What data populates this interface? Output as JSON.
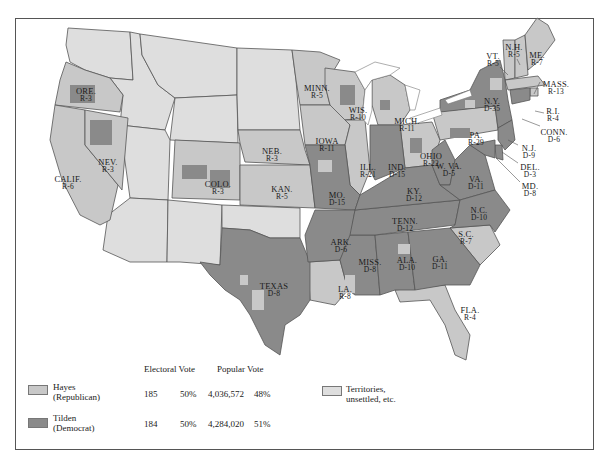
{
  "colors": {
    "republican": "#c8c8c8",
    "democrat": "#8a8a8a",
    "territory": "#dedede",
    "border": "#555555",
    "water": "#ffffff"
  },
  "legend": {
    "header_electoral": "Electoral Vote",
    "header_popular": "Popular Vote",
    "rows": [
      {
        "name": "Hayes",
        "party": "(Republican)",
        "electoral": "185",
        "electoral_pct": "50%",
        "popular": "4,036,572",
        "popular_pct": "48%"
      },
      {
        "name": "Tilden",
        "party": "(Democrat)",
        "electoral": "184",
        "electoral_pct": "50%",
        "popular": "4,284,020",
        "popular_pct": "51%"
      }
    ],
    "territory_line1": "Territories,",
    "territory_line2": "unsettled, etc."
  },
  "states": [
    {
      "abbr": "ORE.",
      "ev": "R-3"
    },
    {
      "abbr": "CALIF.",
      "ev": "R-6"
    },
    {
      "abbr": "NEV.",
      "ev": "R-3"
    },
    {
      "abbr": "COLO.",
      "ev": "R-3"
    },
    {
      "abbr": "NEB.",
      "ev": "R-3"
    },
    {
      "abbr": "KAN.",
      "ev": "R-5"
    },
    {
      "abbr": "TEXAS",
      "ev": "D-8"
    },
    {
      "abbr": "MINN.",
      "ev": "R-5"
    },
    {
      "abbr": "IOWA",
      "ev": "R-11"
    },
    {
      "abbr": "MO.",
      "ev": "D-15"
    },
    {
      "abbr": "ARK.",
      "ev": "D-6"
    },
    {
      "abbr": "LA.",
      "ev": "R-8"
    },
    {
      "abbr": "WIS.",
      "ev": "R-10"
    },
    {
      "abbr": "ILL.",
      "ev": "R-21"
    },
    {
      "abbr": "MISS.",
      "ev": "D-8"
    },
    {
      "abbr": "MICH.",
      "ev": "R-11"
    },
    {
      "abbr": "IND.",
      "ev": "D-15"
    },
    {
      "abbr": "KY.",
      "ev": "D-12"
    },
    {
      "abbr": "TENN.",
      "ev": "D-12"
    },
    {
      "abbr": "ALA.",
      "ev": "D-10"
    },
    {
      "abbr": "OHIO",
      "ev": "R-22"
    },
    {
      "abbr": "W. VA.",
      "ev": "D-5"
    },
    {
      "abbr": "VA.",
      "ev": "D-11"
    },
    {
      "abbr": "N.C.",
      "ev": "D-10"
    },
    {
      "abbr": "S.C.",
      "ev": "R-7"
    },
    {
      "abbr": "GA.",
      "ev": "D-11"
    },
    {
      "abbr": "FLA.",
      "ev": "R-4"
    },
    {
      "abbr": "PA.",
      "ev": "R-29"
    },
    {
      "abbr": "N.Y.",
      "ev": "D-35"
    },
    {
      "abbr": "VT.",
      "ev": "R-5"
    },
    {
      "abbr": "N.H.",
      "ev": "R-5"
    },
    {
      "abbr": "ME.",
      "ev": "R-7"
    },
    {
      "abbr": "MASS.",
      "ev": "R-13"
    },
    {
      "abbr": "R.I.",
      "ev": "R-4"
    },
    {
      "abbr": "CONN.",
      "ev": "D-6"
    },
    {
      "abbr": "N.J.",
      "ev": "D-9"
    },
    {
      "abbr": "DEL.",
      "ev": "D-3"
    },
    {
      "abbr": "MD.",
      "ev": "D-8"
    }
  ]
}
